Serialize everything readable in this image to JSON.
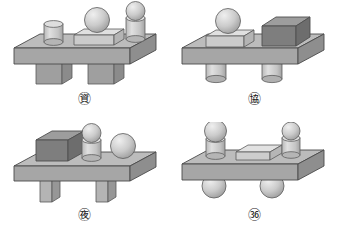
{
  "page": {
    "background_color": "#ffffff"
  },
  "palette": {
    "slab_top": "#b9b9b9",
    "slab_front": "#a3a3a3",
    "slab_side": "#8f8f8f",
    "slab_outline": "#4a4a4a",
    "light_top": "#dcdcdc",
    "light_front": "#c8c8c8",
    "light_side": "#b4b4b4",
    "dark_top": "#9a9a9a",
    "dark_front": "#7d7d7d",
    "dark_side": "#6d6d6d",
    "sphere_light": "#e2e2e2",
    "sphere_mid": "#c2c2c2",
    "sphere_dark": "#9c9c9c",
    "cylinder_light": "#dadada",
    "cylinder_mid": "#c4c4c4",
    "cylinder_dark": "#a8a8a8",
    "outline": "#555555"
  },
  "figures": [
    {
      "id": "ga",
      "label": "㊮",
      "label_text": "ga",
      "base": {
        "shape": "slab",
        "tone": "medium"
      },
      "legs": {
        "shape": "rectangular-block",
        "count": 2,
        "width": "wide"
      },
      "top_objects": [
        {
          "name": "cylinder",
          "tone": "light",
          "position": "left",
          "stack": [
            "cylinder"
          ]
        },
        {
          "name": "box-with-sphere",
          "tone": "light",
          "position": "center",
          "stack": [
            "box",
            "sphere"
          ]
        },
        {
          "name": "cylinder-with-sphere",
          "tone": "light",
          "position": "right",
          "stack": [
            "cylinder",
            "sphere"
          ]
        }
      ]
    },
    {
      "id": "na",
      "label": "㊯",
      "label_text": "na",
      "base": {
        "shape": "slab",
        "tone": "medium"
      },
      "legs": {
        "shape": "cylinder",
        "count": 2,
        "width": "narrow"
      },
      "top_objects": [
        {
          "name": "box-with-sphere",
          "tone": "light",
          "position": "left",
          "stack": [
            "box",
            "sphere"
          ]
        },
        {
          "name": "cube",
          "tone": "dark",
          "position": "right",
          "stack": [
            "cube"
          ]
        }
      ]
    },
    {
      "id": "da",
      "label": "㊰",
      "label_text": "da",
      "base": {
        "shape": "slab",
        "tone": "medium"
      },
      "legs": {
        "shape": "rectangular-block",
        "count": 2,
        "width": "narrow"
      },
      "top_objects": [
        {
          "name": "cube",
          "tone": "dark",
          "position": "left",
          "stack": [
            "cube"
          ]
        },
        {
          "name": "cylinder-with-sphere",
          "tone": "light",
          "position": "center",
          "stack": [
            "cylinder",
            "sphere"
          ]
        },
        {
          "name": "sphere",
          "tone": "light",
          "position": "right",
          "stack": [
            "sphere"
          ]
        }
      ]
    },
    {
      "id": "ra",
      "label": "㊱",
      "label_text": "ra",
      "base": {
        "shape": "slab",
        "tone": "medium"
      },
      "legs": {
        "shape": "sphere",
        "count": 2,
        "width": "narrow"
      },
      "top_objects": [
        {
          "name": "cylinder-with-sphere",
          "tone": "light",
          "position": "left",
          "stack": [
            "cylinder",
            "sphere"
          ]
        },
        {
          "name": "flat-box",
          "tone": "light",
          "position": "center",
          "stack": [
            "flat-box"
          ]
        },
        {
          "name": "cylinder-with-sphere",
          "tone": "light",
          "position": "right",
          "stack": [
            "cylinder",
            "sphere"
          ]
        }
      ]
    }
  ]
}
